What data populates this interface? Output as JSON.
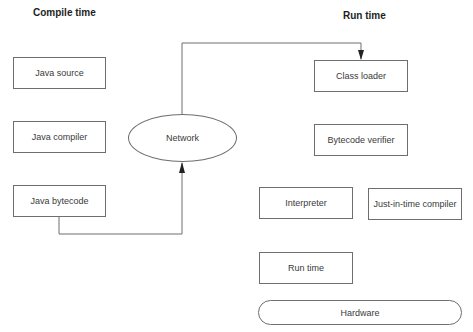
{
  "headings": {
    "compile_time": "Compile time",
    "run_time": "Run time"
  },
  "compile_side": {
    "nodes": [
      {
        "id": "java-source",
        "label": "Java source"
      },
      {
        "id": "java-compiler",
        "label": "Java compiler"
      },
      {
        "id": "java-bytecode",
        "label": "Java bytecode"
      }
    ]
  },
  "network": {
    "label": "Network"
  },
  "run_side": {
    "nodes": [
      {
        "id": "class-loader",
        "label": "Class loader"
      },
      {
        "id": "bytecode-verifier",
        "label": "Bytecode verifier"
      },
      {
        "id": "interpreter",
        "label": "Interpreter"
      },
      {
        "id": "jit-compiler",
        "label": "Just-in-time compiler"
      },
      {
        "id": "run-time",
        "label": "Run time"
      },
      {
        "id": "hardware",
        "label": "Hardware"
      }
    ]
  },
  "edges": [
    {
      "from": "Java bytecode",
      "to": "Network",
      "arrow": "end"
    },
    {
      "from": "Network",
      "to": "Class loader",
      "arrow": "end"
    }
  ],
  "colors": {
    "stroke": "#6e6e6e",
    "text": "#3a3a3a",
    "background": "#ffffff"
  }
}
